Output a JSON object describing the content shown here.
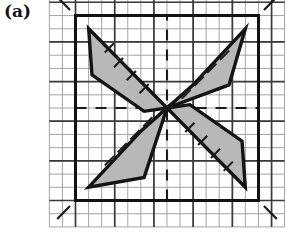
{
  "figure": {
    "panel_label": "(a)",
    "caption_text": "",
    "background_color": "#ffffff",
    "ink_color": "#1a1a1a",
    "petal_fill_color": "#b8b8b8",
    "grid_minor_color": "#9a9a9a",
    "grid_major_color": "#3a3a3a",
    "frame_color": "#121212"
  },
  "chart_data": {
    "type": "scatter",
    "title": "",
    "subtitle": "",
    "xlabel": "",
    "ylabel": "",
    "xlim": [
      -5,
      5
    ],
    "ylim": [
      -5,
      5
    ],
    "grid": true,
    "legend_position": "none",
    "tick_labels_x": [],
    "tick_labels_y": [],
    "annotations": [],
    "center_point": [
      0,
      0
    ],
    "frame_square": {
      "x_min": -5,
      "x_max": 5,
      "y_min": -5,
      "y_max": 5,
      "stroke_width_px": 3
    },
    "minor_grid_step": 0.714,
    "major_grid_step": 2.143,
    "dashed_axes": [
      {
        "name": "horizontal-center-axis",
        "y": 0,
        "x_from": -5,
        "x_to": 5
      },
      {
        "name": "vertical-center-axis",
        "x": 0,
        "y_from": -5,
        "y_to": 5
      }
    ],
    "series": [
      {
        "name": "petal-upper-left",
        "fill": "#b8b8b8",
        "stroke": "#141414",
        "vertices": [
          [
            0.0,
            0.0
          ],
          [
            -4.28,
            4.28
          ],
          [
            -4.1,
            1.79
          ],
          [
            -1.25,
            -0.18
          ]
        ]
      },
      {
        "name": "petal-upper-right",
        "fill": "#b8b8b8",
        "stroke": "#141414",
        "vertices": [
          [
            0.0,
            0.0
          ],
          [
            1.43,
            1.25
          ],
          [
            4.28,
            4.28
          ],
          [
            3.39,
            1.25
          ]
        ]
      },
      {
        "name": "petal-lower-left",
        "fill": "#b8b8b8",
        "stroke": "#141414",
        "vertices": [
          [
            0.0,
            0.0
          ],
          [
            -1.43,
            -1.25
          ],
          [
            -4.28,
            -4.28
          ],
          [
            -1.25,
            -3.75
          ]
        ]
      },
      {
        "name": "petal-lower-right",
        "fill": "#b8b8b8",
        "stroke": "#141414",
        "vertices": [
          [
            0.0,
            0.0
          ],
          [
            1.25,
            0.18
          ],
          [
            4.1,
            -1.79
          ],
          [
            4.28,
            -4.28
          ]
        ]
      }
    ],
    "hatch_ticks": [
      {
        "name": "hatch-upper-left",
        "points": [
          [
            -3.4,
            3.0
          ],
          [
            -2.9,
            3.5
          ]
        ]
      },
      {
        "name": "hatch-upper-left",
        "points": [
          [
            -2.9,
            2.2
          ],
          [
            -2.4,
            2.7
          ]
        ]
      },
      {
        "name": "hatch-upper-left",
        "points": [
          [
            -2.2,
            1.5
          ],
          [
            -1.7,
            2.0
          ]
        ]
      },
      {
        "name": "hatch-upper-left",
        "points": [
          [
            -1.5,
            0.8
          ],
          [
            -1.0,
            1.3
          ]
        ]
      },
      {
        "name": "hatch-upper-right",
        "points": [
          [
            2.9,
            2.6
          ],
          [
            3.4,
            3.1
          ]
        ]
      },
      {
        "name": "hatch-upper-right",
        "points": [
          [
            2.2,
            1.9
          ],
          [
            2.7,
            2.4
          ]
        ]
      },
      {
        "name": "hatch-upper-right",
        "points": [
          [
            1.5,
            1.2
          ],
          [
            2.0,
            1.7
          ]
        ]
      },
      {
        "name": "hatch-upper-right",
        "points": [
          [
            0.8,
            0.5
          ],
          [
            1.3,
            1.0
          ]
        ]
      },
      {
        "name": "hatch-lower-left",
        "points": [
          [
            -3.4,
            -3.1
          ],
          [
            -2.9,
            -2.6
          ]
        ]
      },
      {
        "name": "hatch-lower-left",
        "points": [
          [
            -2.7,
            -2.4
          ],
          [
            -2.2,
            -1.9
          ]
        ]
      },
      {
        "name": "hatch-lower-left",
        "points": [
          [
            -2.0,
            -1.7
          ],
          [
            -1.5,
            -1.2
          ]
        ]
      },
      {
        "name": "hatch-lower-left",
        "points": [
          [
            -1.3,
            -1.0
          ],
          [
            -0.8,
            -0.5
          ]
        ]
      },
      {
        "name": "hatch-lower-right",
        "points": [
          [
            1.0,
            -1.3
          ],
          [
            1.5,
            -0.8
          ]
        ]
      },
      {
        "name": "hatch-lower-right",
        "points": [
          [
            1.7,
            -2.0
          ],
          [
            2.2,
            -1.5
          ]
        ]
      },
      {
        "name": "hatch-lower-right",
        "points": [
          [
            2.4,
            -2.7
          ],
          [
            2.9,
            -2.2
          ]
        ]
      },
      {
        "name": "hatch-lower-right",
        "points": [
          [
            3.1,
            -3.4
          ],
          [
            3.6,
            -2.9
          ]
        ]
      }
    ],
    "corner_ticks": [
      {
        "name": "corner-tick-top-left",
        "points": [
          [
            -6.0,
            6.0
          ],
          [
            -5.3,
            5.3
          ]
        ]
      },
      {
        "name": "corner-tick-top-right",
        "points": [
          [
            5.3,
            5.3
          ],
          [
            6.0,
            6.0
          ]
        ]
      },
      {
        "name": "corner-tick-bottom-left",
        "points": [
          [
            -6.0,
            -6.0
          ],
          [
            -5.3,
            -5.3
          ]
        ]
      },
      {
        "name": "corner-tick-bottom-right",
        "points": [
          [
            5.3,
            -5.3
          ],
          [
            6.0,
            -6.0
          ]
        ]
      }
    ]
  }
}
